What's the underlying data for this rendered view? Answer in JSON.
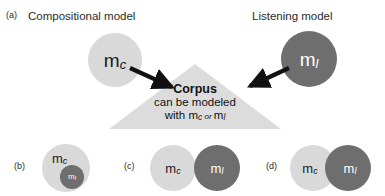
{
  "figure": {
    "background_color": "#ffffff",
    "colors": {
      "compositional_circle": "#d9d9d9",
      "listening_circle": "#6e6e6e",
      "triangle": "#dcdcdc",
      "arrow": "#111111",
      "text_dark": "#1a1a1a",
      "text_light": "#ffffff"
    }
  },
  "panel_a": {
    "label": "(a)",
    "left_title": "Compositional model",
    "right_title": "Listening model",
    "compositional_symbol": {
      "base": "m",
      "sub": "c"
    },
    "listening_symbol": {
      "base": "m",
      "sub": "l"
    },
    "corpus": {
      "title": "Corpus",
      "line2": "can be modeled",
      "line3_prefix": "with ",
      "line3_first": {
        "base": "m",
        "sub": "c"
      },
      "line3_conjunction": " or ",
      "line3_second": {
        "base": "m",
        "sub": "l"
      }
    },
    "arrows": [
      {
        "name": "arrow-compositional-to-corpus",
        "direction": "down-right"
      },
      {
        "name": "arrow-listening-to-corpus",
        "direction": "down-left"
      }
    ]
  },
  "panel_b": {
    "label": "(b)",
    "relation": "nested",
    "outer_symbol": {
      "base": "m",
      "sub": "c"
    },
    "inner_symbol": {
      "base": "m",
      "sub": "l"
    }
  },
  "panel_c": {
    "label": "(c)",
    "relation": "tangent",
    "left_symbol": {
      "base": "m",
      "sub": "c"
    },
    "right_symbol": {
      "base": "m",
      "sub": "l"
    }
  },
  "panel_d": {
    "label": "(d)",
    "relation": "overlapping",
    "left_symbol": {
      "base": "m",
      "sub": "c"
    },
    "right_symbol": {
      "base": "m",
      "sub": "l"
    }
  }
}
